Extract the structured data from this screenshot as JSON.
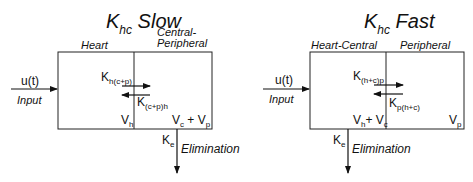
{
  "left": {
    "title_k": "K",
    "title_sub": "hc",
    "title_word": "Slow",
    "compartment_left": "Heart",
    "compartment_right_line1": "Central-",
    "compartment_right_line2": "Peripheral",
    "input_signal": "u(t)",
    "input_label": "Input",
    "k_forward": "K",
    "k_forward_sub": "h(c+p)",
    "k_backward": "K",
    "k_backward_sub": "(c+p)h",
    "v_left": "V",
    "v_left_sub": "h",
    "v_right_a": "V",
    "v_right_a_sub": "c",
    "v_right_plus": " + ",
    "v_right_b": "V",
    "v_right_b_sub": "p",
    "k_elim": "K",
    "k_elim_sub": "e",
    "elim_label": "Elimination"
  },
  "right": {
    "title_k": "K",
    "title_sub": "hc",
    "title_word": "Fast",
    "compartment_left": "Heart-Central",
    "compartment_right": "Peripheral",
    "input_signal": "u(t)",
    "input_label": "Input",
    "k_forward": "K",
    "k_forward_sub": "(h+c)p",
    "k_backward": "K",
    "k_backward_sub": "p(h+c)",
    "v_left_a": "V",
    "v_left_a_sub": "h",
    "v_left_plus": "+ ",
    "v_left_b": "V",
    "v_left_b_sub": "c",
    "v_right": "V",
    "v_right_sub": "p",
    "k_elim": "K",
    "k_elim_sub": "e",
    "elim_label": "Elimination"
  }
}
